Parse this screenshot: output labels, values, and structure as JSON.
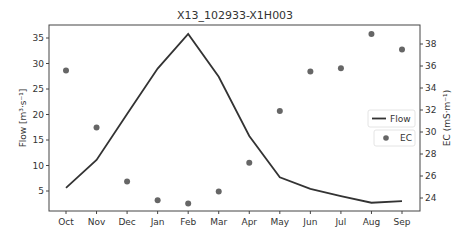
{
  "chart_data": {
    "type": "line",
    "title": "X13_102933-X1H003",
    "xlabel": "",
    "ylabel": "Flow [m³·s⁻¹]",
    "ylabel_right": "EC (mS·m⁻¹)",
    "categories": [
      "Oct",
      "Nov",
      "Dec",
      "Jan",
      "Feb",
      "Mar",
      "Apr",
      "May",
      "Jun",
      "Jul",
      "Aug",
      "Sep"
    ],
    "series": [
      {
        "name": "Flow",
        "kind": "line",
        "axis": "left",
        "color": "#333333",
        "values": [
          5.6,
          11.1,
          20.1,
          29.0,
          35.8,
          27.4,
          15.8,
          7.7,
          5.4,
          4.0,
          2.7,
          3.0
        ]
      },
      {
        "name": "EC",
        "kind": "scatter",
        "axis": "right",
        "color": "#666666",
        "values": [
          35.6,
          30.4,
          25.5,
          23.8,
          23.5,
          24.6,
          27.2,
          31.9,
          35.5,
          35.8,
          38.9,
          37.5
        ]
      }
    ],
    "yticks_left": [
      5,
      10,
      15,
      20,
      25,
      30,
      35
    ],
    "yticks_right": [
      24,
      26,
      28,
      30,
      32,
      34,
      36,
      38
    ],
    "ylim_left": [
      1.5,
      37.5
    ],
    "ylim_right": [
      22.9,
      39.6
    ],
    "grid": false,
    "legend": [
      "Flow",
      "EC"
    ],
    "legend_position": "center right"
  }
}
